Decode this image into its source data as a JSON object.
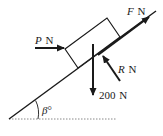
{
  "diagram": {
    "type": "inclined-plane-force-diagram",
    "colors": {
      "stroke": "#1a1a1a",
      "ground": "#888888",
      "background": "#ffffff"
    },
    "labels": {
      "force_F": {
        "symbol": "F",
        "unit": "N"
      },
      "force_P": {
        "symbol": "P",
        "unit": "N"
      },
      "force_R": {
        "symbol": "R",
        "unit": "N"
      },
      "weight": {
        "value": "200",
        "unit": "N"
      },
      "angle": {
        "symbol": "β",
        "unit": "°"
      }
    }
  }
}
